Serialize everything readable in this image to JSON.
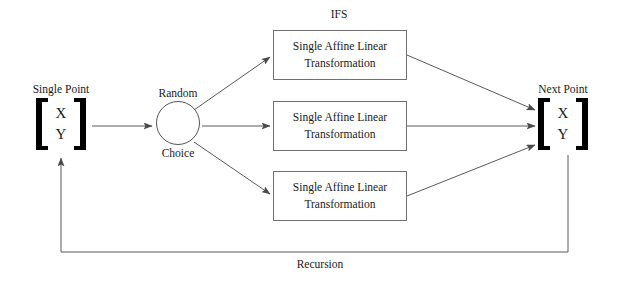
{
  "diagram": {
    "title_label": "IFS",
    "recursion_label": "Recursion",
    "input_node": {
      "caption": "Single Point",
      "row1": "X",
      "row2": "Y"
    },
    "output_node": {
      "caption": "Next Point",
      "row1": "X",
      "row2": "Y"
    },
    "choice_node": {
      "caption_above": "Random",
      "caption_below": "Choice"
    },
    "transform_boxes": [
      {
        "line1": "Single Affine Linear",
        "line2": "Transformation"
      },
      {
        "line1": "Single Affine Linear",
        "line2": "Transformation"
      },
      {
        "line1": "Single Affine Linear",
        "line2": "Transformation"
      }
    ],
    "colors": {
      "stroke": "#5a5a5a",
      "box_border": "#707070",
      "bracket": "#000000",
      "text": "#1a1a1a",
      "background": "#ffffff"
    }
  }
}
